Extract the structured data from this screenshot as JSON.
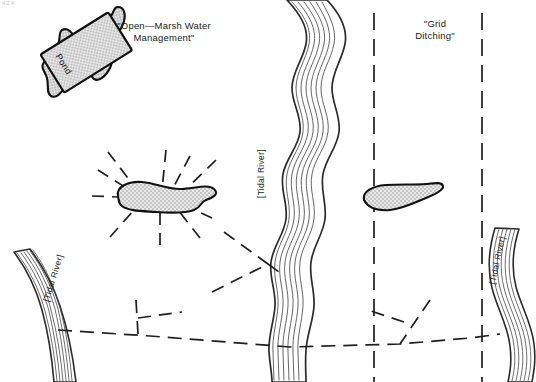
{
  "figure": {
    "page_marker": "424",
    "annotations": {
      "omwm": "\"Open—Marsh Water\nManagement\"",
      "grid_ditching": "\"Grid\nDitching\"",
      "pond": "Pond",
      "tidal_river_center": "[Tidal River]",
      "tidal_river_left": "[Tidal River]",
      "tidal_river_right": "[Tidal River]"
    },
    "colors": {
      "ink": "#1a1a1a",
      "pond_fill": "#d2d2d2",
      "background": "#ffffff",
      "river_line": "#333333"
    },
    "features": [
      {
        "name": "pond-inset-rectangle",
        "type": "hatched-pond",
        "label": "Pond"
      },
      {
        "name": "pond-inset-channel-left",
        "type": "wavy-channel"
      },
      {
        "name": "pond-inset-channel-right",
        "type": "wavy-channel"
      },
      {
        "name": "omwm-pond",
        "type": "hatched-pond",
        "radial_ditches": 9
      },
      {
        "name": "grid-pond",
        "type": "hatched-pond",
        "radial_ditches": 0
      },
      {
        "name": "tidal-river-center",
        "type": "river"
      },
      {
        "name": "tidal-river-left",
        "type": "river"
      },
      {
        "name": "tidal-river-right",
        "type": "river"
      },
      {
        "name": "grid-ditch-vertical-1",
        "type": "dashed-ditch"
      },
      {
        "name": "grid-ditch-vertical-2",
        "type": "dashed-ditch"
      },
      {
        "name": "ditch-horizontal-main",
        "type": "dashed-ditch"
      }
    ]
  }
}
